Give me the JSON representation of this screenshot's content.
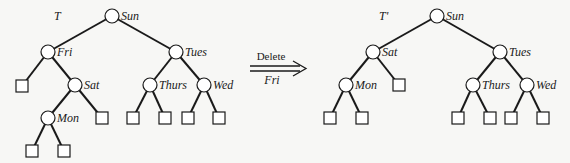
{
  "left_tree": {
    "title": "T",
    "nodes": {
      "sun": "Sun",
      "fri": "Fri",
      "tues": "Tues",
      "sat": "Sat",
      "thurs": "Thurs",
      "wed": "Wed",
      "mon": "Mon"
    }
  },
  "operation": {
    "action": "Delete",
    "key": "Fri"
  },
  "right_tree": {
    "title": "T'",
    "nodes": {
      "sun": "Sun",
      "sat": "Sat",
      "tues": "Tues",
      "mon": "Mon",
      "thurs": "Thurs",
      "wed": "Wed"
    }
  }
}
